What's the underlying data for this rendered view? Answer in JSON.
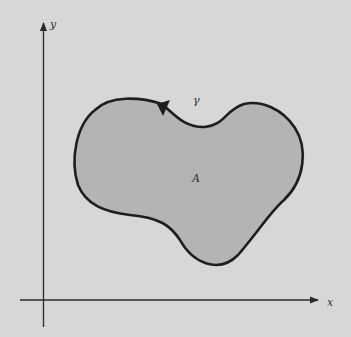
{
  "figure": {
    "axes": {
      "x_label": "x",
      "y_label": "y"
    },
    "curve_label": "γ",
    "region_label": "A",
    "colors": {
      "background": "#d7d7d7",
      "region_fill": "#b4b4b4",
      "curve_stroke": "#1e1e1e",
      "axis_stroke": "#2a2a2a"
    }
  }
}
